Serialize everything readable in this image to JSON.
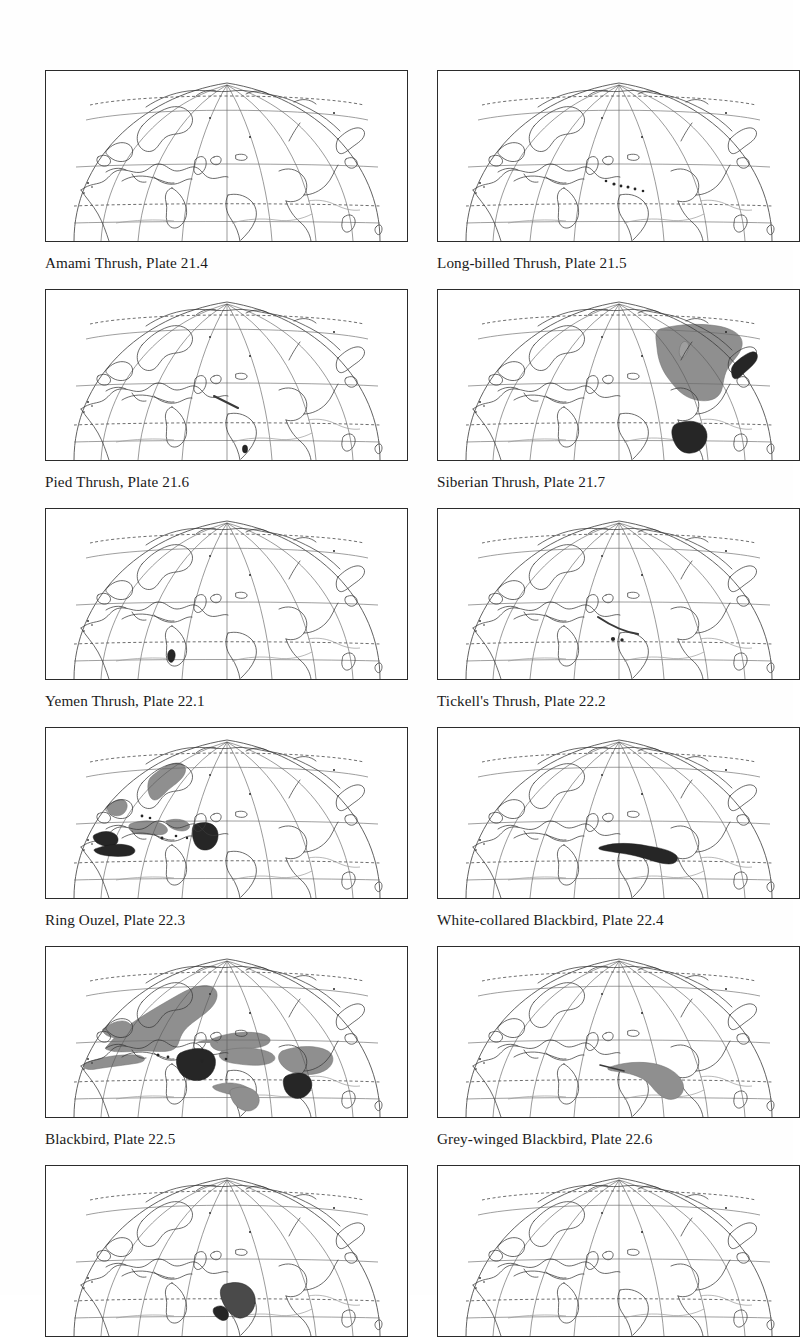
{
  "page": {
    "type": "distribution-map-plate-page",
    "columns": 2,
    "rows": 6,
    "map_projection_note": "Eurasia / Africa hemisphere graticule"
  },
  "colors": {
    "range_grey": "#8f8f8f",
    "range_dark": "#262626",
    "coastline": "#3a3a3a",
    "graticule": "#585858",
    "page_background": "#fefefe",
    "text": "#1a1a1a"
  },
  "maps": [
    {
      "id": "map-1",
      "species": "Amami Thrush",
      "plate": "Plate 21.4",
      "caption": "Amami Thrush, Plate 21.4",
      "ranges": []
    },
    {
      "id": "map-2",
      "species": "Long-billed Thrush",
      "plate": "Plate 21.5",
      "caption": "Long-billed Thrush, Plate 21.5",
      "ranges": [
        {
          "kind": "dots",
          "region": "Himalaya",
          "count": 6
        }
      ]
    },
    {
      "id": "map-3",
      "species": "Pied Thrush",
      "plate": "Plate 21.6",
      "caption": "Pied Thrush, Plate 21.6",
      "ranges": [
        {
          "kind": "line",
          "region": "Himalaya"
        },
        {
          "kind": "dark",
          "region": "Sri Lanka"
        }
      ]
    },
    {
      "id": "map-4",
      "species": "Siberian Thrush",
      "plate": "Plate 21.7",
      "caption": "Siberian Thrush, Plate 21.7",
      "ranges": [
        {
          "kind": "grey",
          "region": "Siberia breeding range"
        },
        {
          "kind": "dark",
          "region": "Japan"
        },
        {
          "kind": "dark",
          "region": "Indochina wintering range"
        }
      ]
    },
    {
      "id": "map-5",
      "species": "Yemen Thrush",
      "plate": "Plate 22.1",
      "caption": "Yemen Thrush, Plate 22.1",
      "ranges": [
        {
          "kind": "dark",
          "region": "south-west Arabia"
        }
      ]
    },
    {
      "id": "map-6",
      "species": "Tickell's Thrush",
      "plate": "Plate 22.2",
      "caption": "Tickell's Thrush, Plate 22.2",
      "ranges": [
        {
          "kind": "line",
          "region": "Himalaya"
        },
        {
          "kind": "dots",
          "region": "northern India",
          "count": 2
        }
      ]
    },
    {
      "id": "map-7",
      "species": "Ring Ouzel",
      "plate": "Plate 22.3",
      "caption": "Ring Ouzel, Plate 22.3",
      "ranges": [
        {
          "kind": "grey",
          "region": "Scandinavia"
        },
        {
          "kind": "grey",
          "region": "Britain and Ireland"
        },
        {
          "kind": "grey",
          "region": "Alps and central Europe"
        },
        {
          "kind": "grey",
          "region": "Caucasus"
        },
        {
          "kind": "dark",
          "region": "north-west Africa wintering"
        },
        {
          "kind": "dark",
          "region": "Iberia wintering"
        },
        {
          "kind": "dark",
          "region": "Turkey / Caucasus"
        }
      ]
    },
    {
      "id": "map-8",
      "species": "White-collared Blackbird",
      "plate": "Plate 22.4",
      "caption": "White-collared Blackbird, Plate 22.4",
      "ranges": [
        {
          "kind": "dark",
          "region": "Himalaya to south-west China"
        }
      ]
    },
    {
      "id": "map-9",
      "species": "Blackbird",
      "plate": "Plate 22.5",
      "caption": "Blackbird, Plate 22.5",
      "ranges": [
        {
          "kind": "grey",
          "region": "Europe and western Russia"
        },
        {
          "kind": "grey",
          "region": "North Africa coast"
        },
        {
          "kind": "grey",
          "region": "Central Asia"
        },
        {
          "kind": "grey",
          "region": "China"
        },
        {
          "kind": "dark",
          "region": "Iran / Iraq"
        },
        {
          "kind": "dark",
          "region": "south-east China"
        },
        {
          "kind": "grey",
          "region": "Himalaya"
        },
        {
          "kind": "grey",
          "region": "southern India"
        }
      ]
    },
    {
      "id": "map-10",
      "species": "Grey-winged Blackbird",
      "plate": "Plate 22.6",
      "caption": "Grey-winged Blackbird, Plate 22.6",
      "ranges": [
        {
          "kind": "grey",
          "region": "Himalaya to Indochina"
        }
      ]
    },
    {
      "id": "map-11",
      "species": "",
      "plate": "",
      "caption": "",
      "ranges": [
        {
          "kind": "dark",
          "region": "central-eastern India"
        }
      ]
    },
    {
      "id": "map-12",
      "species": "",
      "plate": "",
      "caption": "",
      "ranges": []
    }
  ]
}
